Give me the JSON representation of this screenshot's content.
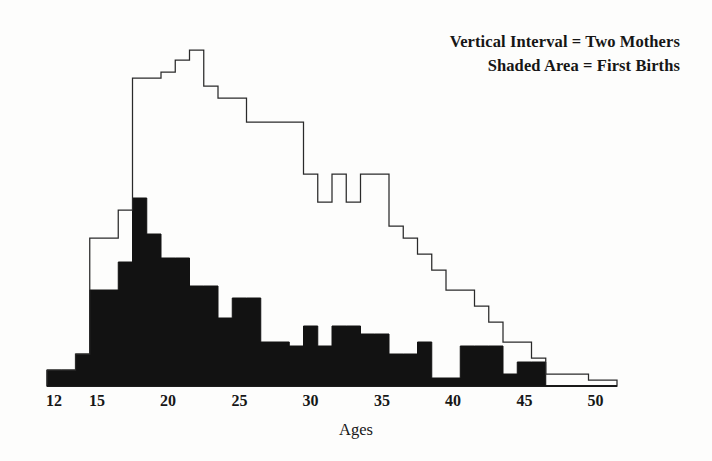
{
  "figure": {
    "background": "#fdfdfc",
    "ink_color": "#111111",
    "fill_color": "#121212",
    "outline_color": "#2a2a2a"
  },
  "legend": {
    "position": "top-right",
    "lines": [
      "Vertical Interval = Two Mothers",
      "Shaded Area = First Births"
    ]
  },
  "axis": {
    "x_title": "Ages",
    "x_tick_labels": [
      "12",
      "15",
      "20",
      "25",
      "30",
      "35",
      "40",
      "45",
      "50"
    ],
    "x_tick_values": [
      12,
      15,
      20,
      25,
      30,
      35,
      40,
      45,
      50
    ],
    "baseline_present": true,
    "y_axis_visible": false,
    "grid": false
  },
  "chart_data": {
    "type": "bar",
    "title": "",
    "subtitle": "",
    "xlabel": "Ages",
    "ylabel": "",
    "xlim": [
      12,
      52
    ],
    "ylim": [
      0,
      172
    ],
    "grid": false,
    "legend_position": "top-right",
    "y_unit": "Each vertical interval = Two Mothers",
    "note": "Step histogram. Outline = all births (all mothers); shaded/solid black area = first births. Values are in histogram units where one vertical interval equals two mothers.",
    "categories": [
      12,
      13,
      14,
      15,
      16,
      17,
      18,
      19,
      20,
      21,
      22,
      23,
      24,
      25,
      26,
      27,
      28,
      29,
      30,
      31,
      32,
      33,
      34,
      35,
      36,
      37,
      38,
      39,
      40,
      41,
      42,
      43,
      44,
      45,
      46,
      47,
      48,
      49,
      50,
      51
    ],
    "series": [
      {
        "name": "Total Births (outline)",
        "style": "outline",
        "color": "#2a2a2a",
        "values": [
          8,
          8,
          16,
          74,
          74,
          88,
          154,
          154,
          157,
          163,
          168,
          150,
          144,
          144,
          132,
          132,
          132,
          132,
          106,
          92,
          106,
          92,
          106,
          106,
          80,
          74,
          66,
          58,
          48,
          48,
          40,
          32,
          22,
          22,
          14,
          6,
          6,
          6,
          3,
          3
        ]
      },
      {
        "name": "First Births (shaded)",
        "style": "filled",
        "color": "#121212",
        "values": [
          8,
          8,
          16,
          48,
          48,
          62,
          94,
          76,
          64,
          64,
          50,
          50,
          34,
          44,
          44,
          22,
          22,
          20,
          30,
          20,
          30,
          30,
          26,
          26,
          16,
          16,
          22,
          4,
          4,
          20,
          20,
          20,
          6,
          12,
          12,
          0,
          0,
          0,
          0,
          0
        ]
      }
    ]
  },
  "geometry": {
    "plot_left_px": 47,
    "plot_baseline_px": 386,
    "px_per_year": 14.25,
    "px_per_unit": 2.0
  }
}
